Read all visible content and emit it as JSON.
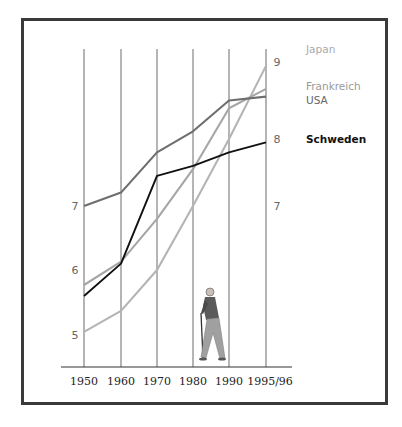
{
  "chart_data": {
    "type": "line",
    "title": "",
    "xlabel": "",
    "ylabel": "",
    "categories": [
      "1950",
      "1960",
      "1970",
      "1980",
      "1990",
      "1995/96"
    ],
    "y_ticks_left": [
      5,
      6,
      7
    ],
    "y_ticks_right": [
      7,
      8,
      9
    ],
    "ylim": [
      4.5,
      9.3
    ],
    "grid": "vertical lines at each category",
    "legend_placement": "right",
    "series": [
      {
        "name": "Japan",
        "color": "#b4b4b4",
        "values": [
          5.05,
          5.37,
          6.0,
          7.0,
          8.0,
          8.95
        ]
      },
      {
        "name": "Frankreich",
        "color": "#a6a6a6",
        "values": [
          5.77,
          6.13,
          6.8,
          7.55,
          8.4,
          8.65
        ]
      },
      {
        "name": "USA",
        "color": "#6e6e6e",
        "values": [
          7.0,
          7.2,
          7.8,
          8.1,
          8.5,
          8.55
        ]
      },
      {
        "name": "Schweden",
        "color": "#111111",
        "values": [
          5.6,
          6.1,
          7.45,
          7.6,
          7.8,
          7.95
        ]
      }
    ],
    "legend": [
      {
        "label": "Japan",
        "color": "#aaaaaa"
      },
      {
        "label": "Frankreich",
        "color": "#999999"
      },
      {
        "label": "USA",
        "color": "#666666"
      },
      {
        "label": "Schweden",
        "color": "#111111"
      }
    ],
    "illustration": "elderly-man-with-cane"
  }
}
